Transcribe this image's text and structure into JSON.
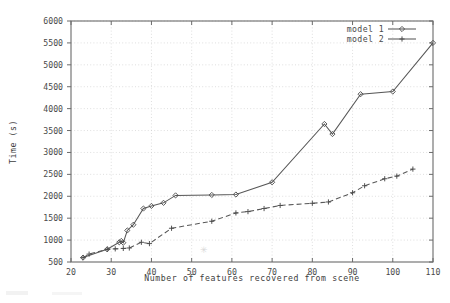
{
  "chart_data": {
    "type": "line",
    "title": "",
    "xlabel": "Number of features recovered from scene",
    "ylabel": "Time (s)",
    "xlim": [
      20,
      110
    ],
    "ylim": [
      500,
      6000
    ],
    "xticks": [
      20,
      30,
      40,
      50,
      60,
      70,
      80,
      90,
      100,
      110
    ],
    "yticks": [
      500,
      1000,
      1500,
      2000,
      2500,
      3000,
      3500,
      4000,
      4500,
      5000,
      5500,
      6000
    ],
    "xtick_labels": [
      "20",
      "30",
      "40",
      "50",
      "60",
      "70",
      "80",
      "90",
      "100",
      "110"
    ],
    "ytick_labels": [
      "500",
      "1000",
      "1500",
      "2000",
      "2500",
      "3000",
      "3500",
      "4000",
      "4500",
      "5000",
      "5500",
      "6000"
    ],
    "grid": true,
    "legend_position": "top-right",
    "series": [
      {
        "name": "model 1",
        "marker": "diamond",
        "linestyle": "solid",
        "color": "#575757",
        "points": [
          [
            23,
            600
          ],
          [
            29,
            790
          ],
          [
            32,
            950
          ],
          [
            32.5,
            980
          ],
          [
            33,
            940
          ],
          [
            34,
            1220
          ],
          [
            35.5,
            1350
          ],
          [
            38,
            1720
          ],
          [
            40,
            1780
          ],
          [
            43,
            1850
          ],
          [
            46,
            2020
          ],
          [
            55,
            2030
          ],
          [
            61,
            2040
          ],
          [
            70,
            2320
          ],
          [
            83,
            3650
          ],
          [
            85,
            3420
          ],
          [
            92,
            4330
          ],
          [
            100,
            4390
          ],
          [
            110,
            5500
          ]
        ]
      },
      {
        "name": "model 2",
        "marker": "plus",
        "linestyle": "dashed",
        "color": "#575757",
        "points": [
          [
            23,
            600
          ],
          [
            24.5,
            680
          ],
          [
            29,
            790
          ],
          [
            31,
            800
          ],
          [
            33,
            810
          ],
          [
            34.5,
            820
          ],
          [
            37.5,
            950
          ],
          [
            39.5,
            920
          ],
          [
            45,
            1270
          ],
          [
            55,
            1430
          ],
          [
            61,
            1620
          ],
          [
            64,
            1650
          ],
          [
            68,
            1720
          ],
          [
            72,
            1790
          ],
          [
            80,
            1840
          ],
          [
            84,
            1870
          ],
          [
            90,
            2080
          ],
          [
            93,
            2240
          ],
          [
            98,
            2400
          ],
          [
            101,
            2460
          ],
          [
            105,
            2620
          ]
        ]
      }
    ],
    "legend": [
      {
        "label": "model 1",
        "marker": "diamond",
        "linestyle": "solid"
      },
      {
        "label": "model 2",
        "marker": "plus",
        "linestyle": "solid"
      }
    ]
  },
  "colors": {
    "background": "#ffffff",
    "axis": "#6b6b6b",
    "grid": "#c9c9c9",
    "text": "#4a4a4a",
    "series": "#575757"
  }
}
